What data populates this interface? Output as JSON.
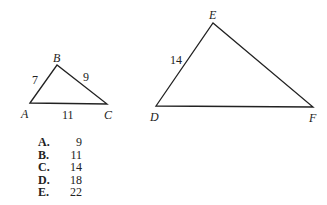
{
  "figure": {
    "triangle_small": {
      "vertices": [
        {
          "label": "A",
          "x": 30,
          "y": 103
        },
        {
          "label": "B",
          "x": 57,
          "y": 65
        },
        {
          "label": "C",
          "x": 107,
          "y": 104
        }
      ],
      "sides": [
        {
          "between": "AB",
          "label": "7"
        },
        {
          "between": "BC",
          "label": "9"
        },
        {
          "between": "AC",
          "label": "11"
        }
      ]
    },
    "triangle_large": {
      "vertices": [
        {
          "label": "D",
          "x": 156,
          "y": 106
        },
        {
          "label": "E",
          "x": 213,
          "y": 23
        },
        {
          "label": "F",
          "x": 313,
          "y": 107
        }
      ],
      "sides": [
        {
          "between": "DE",
          "label": "14"
        }
      ]
    },
    "stroke_color": "#222222"
  },
  "choices": [
    {
      "letter": "A.",
      "value": "9"
    },
    {
      "letter": "B.",
      "value": "11"
    },
    {
      "letter": "C.",
      "value": "14"
    },
    {
      "letter": "D.",
      "value": "18"
    },
    {
      "letter": "E.",
      "value": "22"
    }
  ]
}
